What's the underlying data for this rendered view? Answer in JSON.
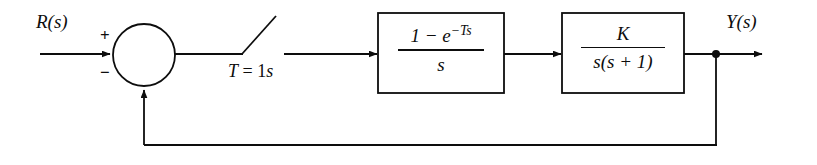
{
  "diagram": {
    "background_color": "#ffffff",
    "line_color": "#0d0d0d",
    "input_label": "R(s)",
    "output_label": "Y(s)",
    "summing_junction": {
      "name": "summing-junction",
      "plus_sign": "+",
      "minus_sign": "−"
    },
    "sampler": {
      "name": "sampler-switch",
      "period_label": "T = 1s",
      "period_symbol": "T",
      "period_equals": "=",
      "period_value": "1",
      "period_unit": "s",
      "state": "open"
    },
    "blocks": [
      {
        "name": "zero-order-hold-block",
        "numerator": "1 − e",
        "numerator_exponent": "−Ts",
        "denominator": "s",
        "transfer_function": "(1 − e^(−Ts)) / s"
      },
      {
        "name": "plant-block",
        "numerator": "K",
        "numerator_exponent": "",
        "denominator": "s(s + 1)",
        "transfer_function": "K / (s(s + 1))"
      }
    ],
    "feedback": {
      "name": "unity-feedback-path",
      "label": "",
      "type": "unity"
    }
  }
}
